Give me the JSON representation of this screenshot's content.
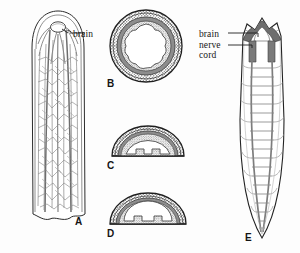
{
  "figure": {
    "background_color": "#fdfdfd",
    "ink_color": "#1d1d1d",
    "tissue_fill": "#8c8c8c",
    "light_fill": "#e9e9e9"
  },
  "labels": {
    "brain_a": "brain",
    "brain_e": "brain",
    "nerve_e": "nerve",
    "cord_e": "cord"
  },
  "panels": [
    {
      "id": "A",
      "letter": "A",
      "name": "whole-body-nerve-net",
      "description": "Elongated flatworm body in dorsal view showing a diffuse branching nerve net with a small anterior brain",
      "view": "dorsal whole mount",
      "features": [
        "brain",
        "nerve net",
        "body margin"
      ]
    },
    {
      "id": "B",
      "letter": "B",
      "name": "circular-cross-section",
      "description": "Circular body cross-section with concentric stippled and shaded tissue layers surrounding a central cavity",
      "view": "transverse section",
      "features": [
        "outer stippled layer",
        "dark muscle ring",
        "inner stippled layer",
        "central cavity"
      ]
    },
    {
      "id": "C",
      "letter": "C",
      "name": "dome-cross-section-scalloped",
      "description": "Dome-shaped (half-round) cross-section with stippled epidermis, dark band and a flat ventral surface with two nerve cord notches",
      "view": "transverse section",
      "features": [
        "epidermis",
        "dark band",
        "ventral nerve cords",
        "flat ventral surface"
      ]
    },
    {
      "id": "D",
      "letter": "D",
      "name": "dome-cross-section-smooth",
      "description": "Dome-shaped cross-section, broader and smoother than C, with stippled layers and two ventral nerve cord notches",
      "view": "transverse section",
      "features": [
        "epidermis",
        "dark band",
        "ventral nerve cords",
        "flat ventral surface"
      ]
    },
    {
      "id": "E",
      "letter": "E",
      "name": "ladder-nervous-system",
      "description": "Ventral view of the ladder-type nervous system: dark anterior brain with radiating head nerves, two longitudinal nerve cords joined by transverse commissures and lateral branches",
      "view": "ventral whole mount",
      "features": [
        "brain",
        "longitudinal nerve cords",
        "transverse commissures",
        "lateral nerves"
      ]
    }
  ]
}
